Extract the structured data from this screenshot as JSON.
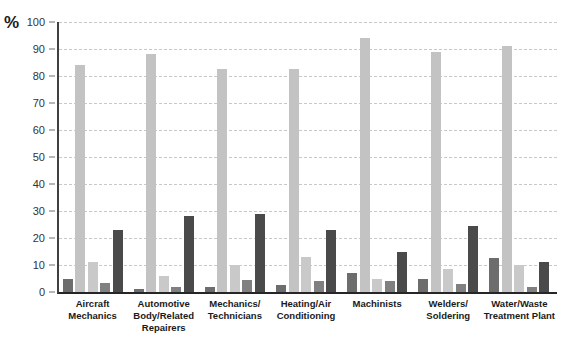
{
  "chart_data": {
    "type": "bar",
    "title": "",
    "subtitle": "",
    "xlabel": "",
    "ylabel": "%",
    "ylim": [
      0,
      100
    ],
    "ytick_labels": [
      "100",
      "90",
      "80",
      "70",
      "60",
      "50",
      "40",
      "30",
      "20",
      "10",
      "0"
    ],
    "ytick_values": [
      100,
      90,
      80,
      70,
      60,
      50,
      40,
      30,
      20,
      10,
      0
    ],
    "grid": true,
    "legend": "none",
    "orientation": "vertical",
    "grouping": "grouped",
    "categories": [
      "Aircraft\nMechanics",
      "Automotive\nBody/Related\nRepairers",
      "Mechanics/\nTechnicians",
      "Heating/Air\nConditioning",
      "Machinists",
      "Welders/\nSoldering",
      "Water/Waste\nTreatment Plant"
    ],
    "category_labels": [
      [
        "Aircraft",
        "Mechanics"
      ],
      [
        "Automotive",
        "Body/Related",
        "Repairers"
      ],
      [
        "Mechanics/",
        "Technicians"
      ],
      [
        "Heating/Air",
        "Conditioning"
      ],
      [
        "Machinists"
      ],
      [
        "Welders/",
        "Soldering"
      ],
      [
        "Water/Waste",
        "Treatment Plant"
      ]
    ],
    "series": [
      {
        "name": "series-1",
        "color": "#6d6d6d",
        "values": [
          5,
          1,
          2,
          2.5,
          7,
          5,
          12.5
        ]
      },
      {
        "name": "series-2",
        "color": "#c3c3c3",
        "values": [
          84,
          88,
          82.5,
          82.5,
          94,
          89,
          91
        ]
      },
      {
        "name": "series-3",
        "color": "#c9c9c9",
        "values": [
          11,
          6,
          10,
          13,
          5,
          8.5,
          10
        ]
      },
      {
        "name": "series-4",
        "color": "#808080",
        "values": [
          3.5,
          2,
          4.5,
          4,
          4,
          3,
          2
        ]
      },
      {
        "name": "series-5",
        "color": "#4a4a4a",
        "values": [
          23,
          28,
          29,
          23,
          15,
          24.5,
          11
        ]
      }
    ]
  },
  "axis": {
    "unit_label": "%"
  },
  "colors": {
    "gridline": "#c8c8c8",
    "axis": "#333333",
    "text": "#1a1a1a",
    "background": "#ffffff"
  }
}
